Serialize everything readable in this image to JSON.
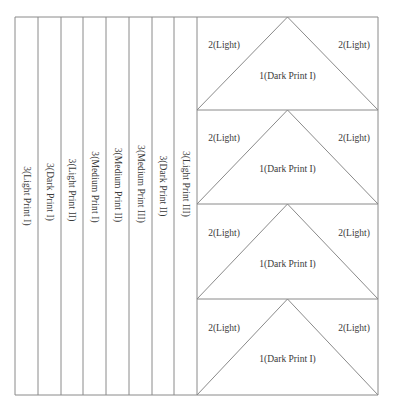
{
  "diagram": {
    "strips": [
      {
        "label": "3(Light Print I)",
        "x0": 15,
        "x1": 38,
        "cy": 196
      },
      {
        "label": "3(Dark Print I)",
        "x0": 38,
        "x1": 61,
        "cy": 192
      },
      {
        "label": "3(Light Print II)",
        "x0": 61,
        "x1": 83,
        "cy": 190
      },
      {
        "label": "3(Medium Print I)",
        "x0": 83,
        "x1": 106,
        "cy": 187
      },
      {
        "label": "3(Medium Print II)",
        "x0": 106,
        "x1": 129,
        "cy": 185
      },
      {
        "label": "3(Medium Print III)",
        "x0": 129,
        "x1": 152,
        "cy": 184
      },
      {
        "label": "3(Dark Print II)",
        "x0": 152,
        "x1": 174,
        "cy": 186
      },
      {
        "label": "3(Light Print III)",
        "x0": 174,
        "x1": 197,
        "cy": 184
      }
    ],
    "triangle_blocks": [
      {
        "y0": 17,
        "y1": 110,
        "left_label": "2(Light)",
        "right_label": "2(Light)",
        "center_label": "1(Dark Print I)"
      },
      {
        "y0": 110,
        "y1": 204,
        "left_label": "2(Light)",
        "right_label": "2(Light)",
        "center_label": "1(Dark Print I)"
      },
      {
        "y0": 204,
        "y1": 299,
        "left_label": "2(Light)",
        "right_label": "2(Light)",
        "center_label": "1(Dark Print I)"
      },
      {
        "y0": 299,
        "y1": 395,
        "left_label": "2(Light)",
        "right_label": "2(Light)",
        "center_label": "1(Dark Print I)"
      }
    ],
    "frame": {
      "left": 15,
      "top": 17,
      "right": 378,
      "bottom": 395,
      "block_left": 197
    },
    "line_color": "#8a8a8a",
    "text_color": "#3a3a3a"
  }
}
